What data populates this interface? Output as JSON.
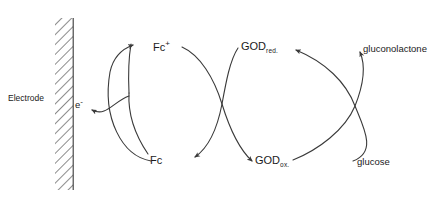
{
  "figure": {
    "background_color": "#ffffff",
    "line_color": "#3a3a3a"
  },
  "electrode": {
    "label": "Electrode",
    "hatch_color": "#6e6e6e",
    "fill_color": "#ffffff"
  },
  "species": {
    "electron": "e",
    "electron_charge": "-",
    "ferrocenium": "Fc",
    "ferrocenium_charge": "+",
    "ferrocene": "Fc",
    "god_base": "GOD",
    "god_reduced_sub": "red.",
    "god_oxidised_sub": "ox.",
    "gluconolactone": "gluconolactone",
    "glucose": "glucose"
  },
  "cycles": [
    {
      "name": "electrode-mediator-cycle",
      "from": "Fc",
      "to": "Fc+",
      "releases": "e-"
    },
    {
      "name": "mediator-enzyme-cycle",
      "from": "Fc+",
      "to": "Fc",
      "couples": "GOD red. / GOD ox."
    },
    {
      "name": "enzyme-substrate-cycle",
      "from": "glucose",
      "to": "gluconolactone",
      "couples": "GOD ox. / GOD red."
    }
  ]
}
